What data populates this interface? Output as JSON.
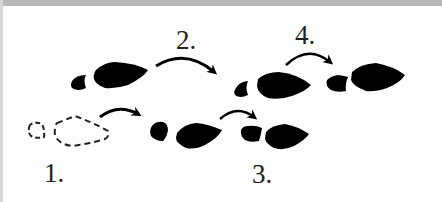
{
  "diagram": {
    "type": "footstep-sequence",
    "colors": {
      "footprint_fill": "#000000",
      "outline_dashed": "#222222",
      "background": "#fdfdfd",
      "top_band": "#b9b9b9"
    },
    "steps": [
      {
        "label": "1.",
        "footprint": "dashed-outline",
        "position": "start"
      },
      {
        "label": "2.",
        "footprint": "solid",
        "position": "upper-left"
      },
      {
        "label": "3.",
        "footprint": "solid",
        "position": "lower-right"
      },
      {
        "label": "4.",
        "footprint": "solid",
        "position": "upper-right"
      }
    ]
  }
}
